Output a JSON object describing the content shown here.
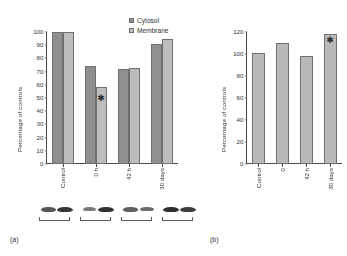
{
  "figure": {
    "panel_a_tag": "(a)",
    "panel_b_tag": "(b)"
  },
  "legend": {
    "items": [
      {
        "label": "Cytosol",
        "color": "#8f8f8f"
      },
      {
        "label": "Membrane",
        "color": "#bdbdbd"
      }
    ]
  },
  "panel_a": {
    "ylabel": "Percentage of controls",
    "yticks": [
      "0",
      "10",
      "20",
      "30",
      "40",
      "50",
      "60",
      "70",
      "80",
      "90",
      "100"
    ],
    "xticks": [
      "Control",
      "0 h",
      "42 h",
      "30 days"
    ],
    "significance_marker": "✱"
  },
  "panel_b": {
    "ylabel": "Percentage of controls",
    "yticks": [
      "0",
      "20",
      "40",
      "60",
      "80",
      "100",
      "120"
    ],
    "xticks": [
      "Control",
      "0",
      "42 h",
      "30 days"
    ],
    "significance_marker": "✱"
  },
  "chart_data": [
    {
      "type": "bar",
      "id": "panel-a",
      "title": "",
      "xlabel": "",
      "ylabel": "Percentage of controls",
      "categories": [
        "Control",
        "0 h",
        "42 h",
        "30 days"
      ],
      "series": [
        {
          "name": "Cytosol",
          "color": "#8f8f8f",
          "values": [
            100,
            74,
            72,
            91
          ]
        },
        {
          "name": "Membrane",
          "color": "#bdbdbd",
          "values": [
            100,
            58,
            73,
            95
          ]
        }
      ],
      "ylim": [
        0,
        100
      ],
      "ytick_step": 10,
      "grid": false,
      "legend_position": "top-right",
      "annotations": [
        {
          "text": "✱",
          "series": "Membrane",
          "category": "0 h",
          "meaning": "significant vs control"
        }
      ]
    },
    {
      "type": "bar",
      "id": "panel-b",
      "title": "",
      "xlabel": "",
      "ylabel": "Percentage of controls",
      "categories": [
        "Control",
        "0",
        "42 h",
        "30 days"
      ],
      "series": [
        {
          "name": "",
          "color": "#b9b9b9",
          "values": [
            101,
            110,
            98,
            118
          ]
        }
      ],
      "ylim": [
        0,
        120
      ],
      "ytick_step": 20,
      "grid": false,
      "legend_position": "none",
      "annotations": [
        {
          "text": "✱",
          "category": "30 days",
          "meaning": "significant vs control"
        }
      ]
    }
  ],
  "blot": {
    "groups": [
      {
        "bands": [
          {
            "intensity": 0.72,
            "width": 15
          },
          {
            "intensity": 0.88,
            "width": 16
          }
        ]
      },
      {
        "bands": [
          {
            "intensity": 0.55,
            "width": 13
          },
          {
            "intensity": 0.9,
            "width": 16
          }
        ]
      },
      {
        "bands": [
          {
            "intensity": 0.68,
            "width": 15
          },
          {
            "intensity": 0.62,
            "width": 14
          }
        ]
      },
      {
        "bands": [
          {
            "intensity": 0.92,
            "width": 16
          },
          {
            "intensity": 0.85,
            "width": 16
          }
        ]
      }
    ]
  }
}
